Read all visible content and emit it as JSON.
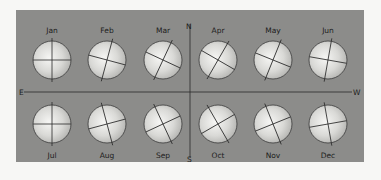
{
  "diagram": {
    "title": "",
    "directions": {
      "north": "N",
      "south": "S",
      "east": "E",
      "west": "W"
    },
    "colors": {
      "background": "#f7f7f5",
      "panel": "#8c8c8a",
      "globe_highlight": "#f4f4f2",
      "globe_shadow": "#b9b9b6",
      "line": "#2a2a2a"
    },
    "globes": [
      {
        "month": "Jan",
        "row": "top",
        "tilt_deg": 0
      },
      {
        "month": "Feb",
        "row": "top",
        "tilt_deg": 15
      },
      {
        "month": "Mar",
        "row": "top",
        "tilt_deg": 25
      },
      {
        "month": "Apr",
        "row": "top",
        "tilt_deg": 30
      },
      {
        "month": "May",
        "row": "top",
        "tilt_deg": 22
      },
      {
        "month": "Jun",
        "row": "top",
        "tilt_deg": 10
      },
      {
        "month": "Jul",
        "row": "bottom",
        "tilt_deg": 0
      },
      {
        "month": "Aug",
        "row": "bottom",
        "tilt_deg": -15
      },
      {
        "month": "Sep",
        "row": "bottom",
        "tilt_deg": -25
      },
      {
        "month": "Oct",
        "row": "bottom",
        "tilt_deg": -30
      },
      {
        "month": "Nov",
        "row": "bottom",
        "tilt_deg": -22
      },
      {
        "month": "Dec",
        "row": "bottom",
        "tilt_deg": -10
      }
    ]
  }
}
